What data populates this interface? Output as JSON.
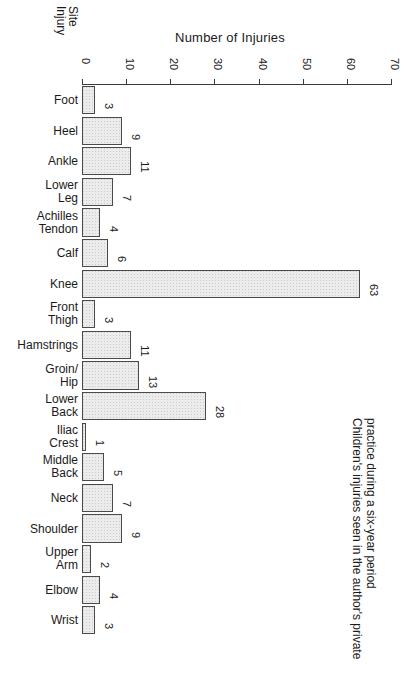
{
  "chart_data": {
    "type": "bar",
    "orientation": "horizontal",
    "title": "",
    "xlabel": "Number of Injuries",
    "ylabel": "Injury Site",
    "xlim": [
      0,
      70
    ],
    "xticks": [
      0,
      10,
      20,
      30,
      40,
      50,
      60,
      70
    ],
    "grid": false,
    "legend": null,
    "categories": [
      "Foot",
      "Heel",
      "Ankle",
      "Lower\nLeg",
      "Achilles\nTendon",
      "Calf",
      "Knee",
      "Front\nThigh",
      "Hamstrings",
      "Groin/\nHip",
      "Lower\nBack",
      "Iliac\nCrest",
      "Middle\nBack",
      "Neck",
      "Shoulder",
      "Upper\nArm",
      "Elbow",
      "Wrist"
    ],
    "values": [
      3,
      9,
      11,
      7,
      4,
      6,
      63,
      3,
      11,
      13,
      28,
      1,
      5,
      7,
      9,
      2,
      4,
      3
    ],
    "value_labels": [
      "3",
      "9",
      "11",
      "7",
      "4",
      "6",
      "63",
      "3",
      "11",
      "13",
      "28",
      "1",
      "5",
      "7",
      "9",
      "2",
      "4",
      "3"
    ],
    "caption": "Children's injuries seen in the author's private practice during a six-year period",
    "caption_lines": [
      "Children's injuries seen in the author's private",
      "practice during a six-year period"
    ],
    "ylabel_lines": [
      "Injury",
      "Site"
    ],
    "colors": {
      "bar_fill": "#ececec",
      "bar_stipple": "#c9c9c9",
      "bar_border": "#4a4a4a",
      "axis": "#3a3a3a",
      "text": "#1a1a1a",
      "background": "#ffffff"
    }
  }
}
